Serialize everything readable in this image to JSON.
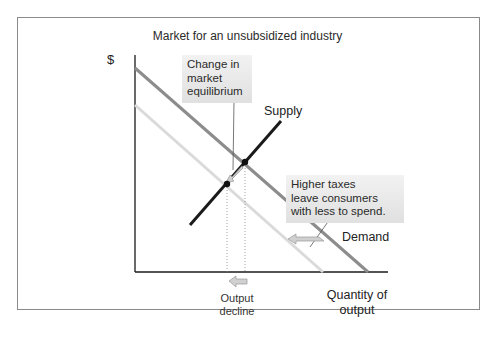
{
  "figure": {
    "title": "Market for an unsubsidized industry",
    "y_axis_label": "$",
    "x_axis_label_line1": "Quantity of",
    "x_axis_label_line2": "output"
  },
  "labels": {
    "supply": "Supply",
    "demand": "Demand"
  },
  "callouts": {
    "equilibrium": {
      "line1": "Change in",
      "line2": "market",
      "line3": "equilibrium"
    },
    "taxes": {
      "line1": "Higher taxes",
      "line2": "leave consumers",
      "line3": "with less to spend."
    }
  },
  "annotations": {
    "output_decline_line1": "Output",
    "output_decline_line2": "decline"
  },
  "colors": {
    "demand_original": "#8c8c8c",
    "demand_shifted": "#d9d9d9",
    "supply": "#1a1a1a",
    "axis": "#1a1a1a",
    "arrow_fill": "#d0d0d0",
    "arrow_stroke": "#9a9a9a",
    "frame": "#8a8a8a"
  }
}
